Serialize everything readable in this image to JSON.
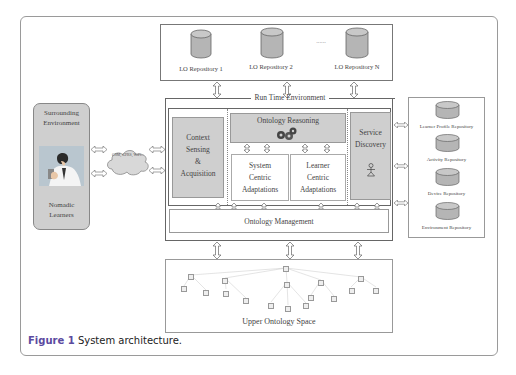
{
  "figure": {
    "caption_label": "Figure 1",
    "caption_text": " System architecture.",
    "accent_color": "#5b4aa0"
  },
  "lo_repositories": {
    "items": [
      {
        "label": "LO Repository 1"
      },
      {
        "label": "LO Repository 2"
      },
      {
        "label": "LO Repository N"
      }
    ],
    "ellipsis": "......"
  },
  "runtime": {
    "title": "Run Time Environment",
    "context": {
      "line1": "Context",
      "line2": "Sensing",
      "line3": "&",
      "line4": "Acquisition"
    },
    "reasoning": {
      "title": "Ontology Reasoning",
      "icon": "gears-icon"
    },
    "system_centric": {
      "line1": "System",
      "line2": "Centric",
      "line3": "Adaptations"
    },
    "learner_centric": {
      "line1": "Learner",
      "line2": "Centric",
      "line3": "Adaptations"
    },
    "service_discovery": {
      "line1": "Service",
      "line2": "Discovery",
      "icon": "agent-icon"
    },
    "management": "Ontology Management"
  },
  "surrounding": {
    "title1": "Surrounding",
    "title2": "Environment",
    "learners1": "Nomadic",
    "learners2": "Learners",
    "network": "GSM, GPRS, WiFi..."
  },
  "side_repositories": [
    {
      "label": "Learner Profile Repository"
    },
    {
      "label": "Activity Repository"
    },
    {
      "label": "Device Repository"
    },
    {
      "label": "Environment Repository"
    }
  ],
  "upper_ontology": {
    "title": "Upper Ontology Space"
  }
}
